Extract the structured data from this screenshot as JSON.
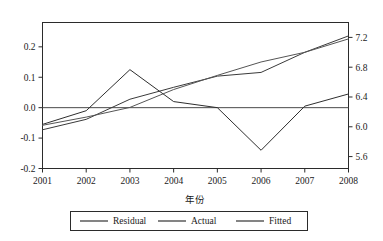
{
  "chart_data": {
    "type": "line",
    "title": "",
    "subtitle": "",
    "xlabel": "年份",
    "ylabel": "",
    "ylabel_right": "",
    "grid": false,
    "legend_position": "bottom",
    "categories": [
      "2001",
      "2002",
      "2003",
      "2004",
      "2005",
      "2006",
      "2007",
      "2008"
    ],
    "x": [
      2001,
      2002,
      2003,
      2004,
      2005,
      2006,
      2007,
      2008
    ],
    "xlim": [
      2001,
      2008
    ],
    "ylim": [
      -0.2,
      0.28
    ],
    "ylim_right": [
      5.44,
      7.4
    ],
    "yticks": [
      0.2,
      0.1,
      0.0,
      -0.1,
      -0.2
    ],
    "ytick_labels": [
      "0.2",
      "0.1",
      "0.0",
      "-0.1",
      "-0.2"
    ],
    "yticks_right": [
      7.2,
      6.8,
      6.4,
      6.0,
      5.6
    ],
    "ytick_labels_right": [
      "7.2",
      "6.8",
      "6.4",
      "6.0",
      "5.6"
    ],
    "xtick_labels": [
      "2001",
      "2002",
      "2003",
      "2004",
      "2005",
      "2006",
      "2007",
      "2008"
    ],
    "zero_line": 0.0,
    "series": [
      {
        "name": "Residual",
        "axis": "left",
        "color": "#2e2e2e",
        "values": [
          -0.055,
          -0.01,
          0.125,
          0.02,
          0.0,
          -0.14,
          0.005,
          0.045
        ]
      },
      {
        "name": "Actual",
        "axis": "right",
        "color": "#3a3a3a",
        "values": [
          5.96,
          6.1,
          6.37,
          6.53,
          6.68,
          6.73,
          7.0,
          7.22
        ]
      },
      {
        "name": "Fitted",
        "axis": "right",
        "color": "#555555",
        "values": [
          6.02,
          6.13,
          6.26,
          6.5,
          6.69,
          6.87,
          7.0,
          7.18
        ]
      }
    ]
  },
  "legend": {
    "items": [
      {
        "label": "Residual"
      },
      {
        "label": "Actual"
      },
      {
        "label": "Fitted"
      }
    ]
  },
  "axis_title": {
    "x": "年份"
  },
  "colors": {
    "axis": "#2b2b2b",
    "background": "#ffffff",
    "residual": "#2e2e2e",
    "actual": "#3a3a3a",
    "fitted": "#555555"
  }
}
